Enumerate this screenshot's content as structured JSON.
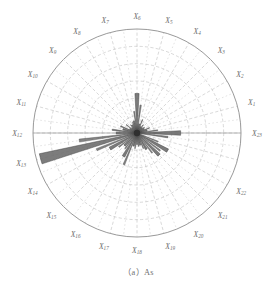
{
  "figure": {
    "caption": "（a）As",
    "caption_label": "(a)",
    "caption_title": "As"
  },
  "chart_data": {
    "type": "bar",
    "subtype": "polar-rose",
    "xlabel": "",
    "ylabel": "",
    "grid": true,
    "legend": "none",
    "center_px": [
      137,
      133
    ],
    "outer_radius_px": 104,
    "radial_rings": 6,
    "angle_start_deg": 0,
    "angle_direction": "counterclockwise",
    "sector_count": 23,
    "categories": [
      "X1",
      "X2",
      "X3",
      "X4",
      "X5",
      "X6",
      "X7",
      "X8",
      "X9",
      "X10",
      "X11",
      "X12",
      "X13",
      "X14",
      "X15",
      "X16",
      "X17",
      "X18",
      "X19",
      "X20",
      "X21",
      "X22",
      "X23"
    ],
    "category_angles_deg": [
      15,
      30,
      45,
      60,
      75,
      90,
      105,
      120,
      135,
      150,
      165,
      180,
      195,
      210,
      225,
      240,
      255,
      270,
      285,
      300,
      315,
      330,
      360
    ],
    "values": [
      0.1,
      0.08,
      0.07,
      0.07,
      0.09,
      0.38,
      0.12,
      0.09,
      0.07,
      0.08,
      0.14,
      0.2,
      0.96,
      0.3,
      0.17,
      0.26,
      0.13,
      0.11,
      0.12,
      0.18,
      0.3,
      0.34,
      0.42
    ],
    "value_unit": "fraction of outer radius",
    "ylim": [
      0,
      1
    ],
    "dominant_direction": "X13",
    "series": [
      {
        "name": "As",
        "values": [
          0.1,
          0.08,
          0.07,
          0.07,
          0.09,
          0.38,
          0.12,
          0.09,
          0.07,
          0.08,
          0.14,
          0.2,
          0.96,
          0.3,
          0.17,
          0.26,
          0.13,
          0.11,
          0.12,
          0.18,
          0.3,
          0.34,
          0.42
        ]
      }
    ],
    "minor_spokes": [
      {
        "angle_deg": 7.5,
        "value": 0.2
      },
      {
        "angle_deg": 22.5,
        "value": 0.13
      },
      {
        "angle_deg": 37.5,
        "value": 0.09
      },
      {
        "angle_deg": 52.5,
        "value": 0.1
      },
      {
        "angle_deg": 67.5,
        "value": 0.14
      },
      {
        "angle_deg": 82.5,
        "value": 0.27
      },
      {
        "angle_deg": 97.5,
        "value": 0.21
      },
      {
        "angle_deg": 112.5,
        "value": 0.11
      },
      {
        "angle_deg": 127.5,
        "value": 0.1
      },
      {
        "angle_deg": 142.5,
        "value": 0.13
      },
      {
        "angle_deg": 157.5,
        "value": 0.17
      },
      {
        "angle_deg": 172.5,
        "value": 0.24
      },
      {
        "angle_deg": 187.5,
        "value": 0.56
      },
      {
        "angle_deg": 202.5,
        "value": 0.42
      },
      {
        "angle_deg": 217.5,
        "value": 0.22
      },
      {
        "angle_deg": 232.5,
        "value": 0.19
      },
      {
        "angle_deg": 247.5,
        "value": 0.33
      },
      {
        "angle_deg": 262.5,
        "value": 0.15
      },
      {
        "angle_deg": 277.5,
        "value": 0.13
      },
      {
        "angle_deg": 292.5,
        "value": 0.16
      },
      {
        "angle_deg": 307.5,
        "value": 0.24
      },
      {
        "angle_deg": 322.5,
        "value": 0.28
      },
      {
        "angle_deg": 337.5,
        "value": 0.22
      },
      {
        "angle_deg": 352.5,
        "value": 0.3
      }
    ]
  },
  "colors": {
    "bar_fill": "#6e6e6e",
    "bar_stroke": "#3a3a3a",
    "grid": "#b9b9b9",
    "outer_ring": "#8d8d8d",
    "label_text": "#6b6b6b",
    "background": "#ffffff"
  },
  "labels": [
    {
      "id": "X1",
      "base": "X",
      "sub": "1"
    },
    {
      "id": "X2",
      "base": "X",
      "sub": "2"
    },
    {
      "id": "X3",
      "base": "X",
      "sub": "3"
    },
    {
      "id": "X4",
      "base": "X",
      "sub": "4"
    },
    {
      "id": "X5",
      "base": "X",
      "sub": "5"
    },
    {
      "id": "X6",
      "base": "X",
      "sub": "6"
    },
    {
      "id": "X7",
      "base": "X",
      "sub": "7"
    },
    {
      "id": "X8",
      "base": "X",
      "sub": "8"
    },
    {
      "id": "X9",
      "base": "X",
      "sub": "9"
    },
    {
      "id": "X10",
      "base": "X",
      "sub": "10"
    },
    {
      "id": "X11",
      "base": "X",
      "sub": "11"
    },
    {
      "id": "X12",
      "base": "X",
      "sub": "12"
    },
    {
      "id": "X13",
      "base": "X",
      "sub": "13"
    },
    {
      "id": "X14",
      "base": "X",
      "sub": "14"
    },
    {
      "id": "X15",
      "base": "X",
      "sub": "15"
    },
    {
      "id": "X16",
      "base": "X",
      "sub": "16"
    },
    {
      "id": "X17",
      "base": "X",
      "sub": "17"
    },
    {
      "id": "X18",
      "base": "X",
      "sub": "18"
    },
    {
      "id": "X19",
      "base": "X",
      "sub": "19"
    },
    {
      "id": "X20",
      "base": "X",
      "sub": "20"
    },
    {
      "id": "X21",
      "base": "X",
      "sub": "21"
    },
    {
      "id": "X22",
      "base": "X",
      "sub": "22"
    },
    {
      "id": "X23",
      "base": "X",
      "sub": "23"
    }
  ]
}
